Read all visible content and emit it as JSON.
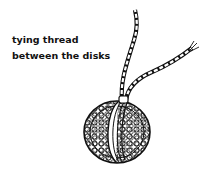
{
  "caption": {
    "line1": "tying thread",
    "line2": "between the disks"
  },
  "illustration": {
    "subject": "woven-ball-with-two-threads",
    "stroke_color": "#111111",
    "background": "#ffffff"
  }
}
